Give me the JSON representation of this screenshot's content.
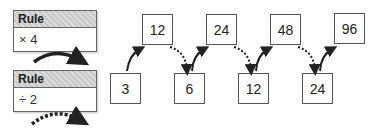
{
  "rules": [
    {
      "header": "Rule",
      "operation": "× 4",
      "arrow": "solid"
    },
    {
      "header": "Rule",
      "operation": "÷ 2",
      "arrow": "dashed"
    }
  ],
  "top_row": [
    "12",
    "24",
    "48",
    "96"
  ],
  "bottom_row": [
    "3",
    "6",
    "12",
    "24"
  ],
  "colors": {
    "border": "#555555",
    "header_fill": "#d0d0d0",
    "arrow": "#222222"
  }
}
